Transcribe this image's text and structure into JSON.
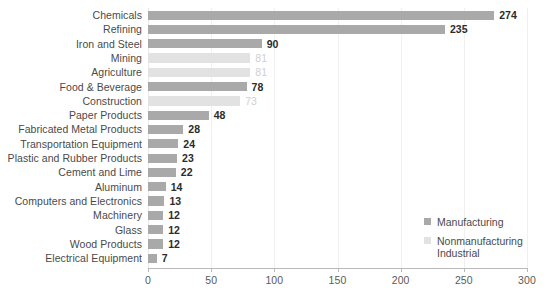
{
  "chart_data": {
    "type": "bar",
    "orientation": "horizontal",
    "title": "",
    "xlabel": "",
    "ylabel": "",
    "xlim": [
      0,
      300
    ],
    "xticks": [
      0,
      50,
      100,
      150,
      200,
      250,
      300
    ],
    "grid": true,
    "legend_position": "right-lower",
    "categories": [
      "Chemicals",
      "Refining",
      "Iron and Steel",
      "Mining",
      "Agriculture",
      "Food & Beverage",
      "Construction",
      "Paper Products",
      "Fabricated Metal Products",
      "Transportation Equipment",
      "Plastic and Rubber Products",
      "Cement and Lime",
      "Aluminum",
      "Computers and Electronics",
      "Machinery",
      "Glass",
      "Wood Products",
      "Electrical Equipment"
    ],
    "values": [
      274,
      235,
      90,
      81,
      81,
      78,
      73,
      48,
      28,
      24,
      23,
      22,
      14,
      13,
      12,
      12,
      12,
      7
    ],
    "groups": [
      "manufacturing",
      "manufacturing",
      "manufacturing",
      "nonmanufacturing",
      "nonmanufacturing",
      "manufacturing",
      "nonmanufacturing",
      "manufacturing",
      "manufacturing",
      "manufacturing",
      "manufacturing",
      "manufacturing",
      "manufacturing",
      "manufacturing",
      "manufacturing",
      "manufacturing",
      "manufacturing",
      "manufacturing"
    ],
    "series": [
      {
        "name": "Manufacturing",
        "color": "#a9a9a9",
        "points": [
          {
            "category": "Chemicals",
            "value": 274
          },
          {
            "category": "Refining",
            "value": 235
          },
          {
            "category": "Iron and Steel",
            "value": 90
          },
          {
            "category": "Food & Beverage",
            "value": 78
          },
          {
            "category": "Paper Products",
            "value": 48
          },
          {
            "category": "Fabricated Metal Products",
            "value": 28
          },
          {
            "category": "Transportation Equipment",
            "value": 24
          },
          {
            "category": "Plastic and Rubber Products",
            "value": 23
          },
          {
            "category": "Cement and Lime",
            "value": 22
          },
          {
            "category": "Aluminum",
            "value": 14
          },
          {
            "category": "Computers and Electronics",
            "value": 13
          },
          {
            "category": "Machinery",
            "value": 12
          },
          {
            "category": "Glass",
            "value": 12
          },
          {
            "category": "Wood Products",
            "value": 12
          },
          {
            "category": "Electrical Equipment",
            "value": 7
          }
        ]
      },
      {
        "name": "Nonmanufacturing Industrial",
        "color": "#e2e2e2",
        "points": [
          {
            "category": "Mining",
            "value": 81
          },
          {
            "category": "Agriculture",
            "value": 81
          },
          {
            "category": "Construction",
            "value": 73
          }
        ]
      }
    ]
  },
  "legend": {
    "entries": [
      {
        "label": "Manufacturing",
        "group": "manufacturing"
      },
      {
        "label": "Nonmanufacturing Industrial",
        "group": "nonmanufacturing"
      }
    ]
  }
}
